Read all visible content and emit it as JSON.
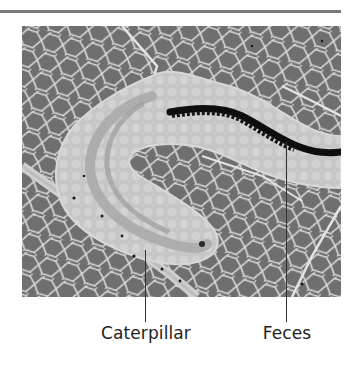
{
  "figure": {
    "photo_alt": "Leaf with a caterpillar and its feces trail",
    "labels": [
      {
        "id": "caterpillar",
        "text": "Caterpillar",
        "line_x": 145,
        "line_top": 250,
        "line_bottom": 322
      },
      {
        "id": "feces",
        "text": "Feces",
        "line_x": 286,
        "line_top": 142,
        "line_bottom": 322
      }
    ]
  },
  "colors": {
    "leaf": "#6f6f6f",
    "veins": "#e6e6e6",
    "mine_trail": "#c9c9c9",
    "feces": "#0e0e0e",
    "rule": "#7a7a7a",
    "text": "#222222"
  }
}
